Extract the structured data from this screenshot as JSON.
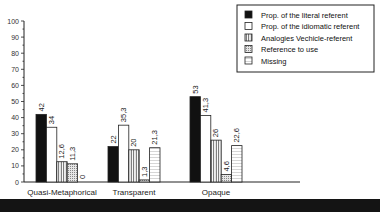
{
  "chart_data": {
    "type": "bar",
    "title": "",
    "xlabel": "",
    "ylabel": "",
    "ylim": [
      0,
      100
    ],
    "yticks": [
      0,
      10,
      20,
      30,
      40,
      50,
      60,
      70,
      80,
      90,
      100
    ],
    "grid": false,
    "legend_position": "top-right",
    "categories": [
      "Quasi-Metaphorical",
      "Transparent",
      "Opaque"
    ],
    "series": [
      {
        "name": "Prop. of the literal referent",
        "pattern": "solid-black",
        "values": [
          42,
          22,
          53
        ],
        "labels": [
          "42",
          "22",
          "53"
        ]
      },
      {
        "name": "Prop. of the idiomatic referent",
        "pattern": "white",
        "values": [
          34,
          35.3,
          41.3
        ],
        "labels": [
          "34",
          "35,3",
          "41,3"
        ]
      },
      {
        "name": "Analogies Vechicle-referent",
        "pattern": "vertical-lines",
        "values": [
          12.6,
          20,
          26
        ],
        "labels": [
          "12,6",
          "20",
          "26"
        ]
      },
      {
        "name": "Reference to use",
        "pattern": "dotted",
        "values": [
          11.3,
          1.3,
          4.6
        ],
        "labels": [
          "11,3",
          "1,3",
          "4,6"
        ]
      },
      {
        "name": "Missing",
        "pattern": "horizontal-lines",
        "values": [
          0,
          21.3,
          22.6
        ],
        "labels": [
          "0",
          "21,3",
          "22,6"
        ]
      }
    ]
  }
}
